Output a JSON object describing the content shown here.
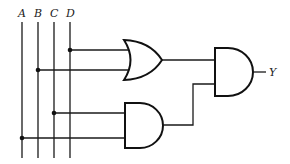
{
  "diagram": {
    "type": "logic-circuit",
    "inputs": [
      {
        "label": "A",
        "x": 22
      },
      {
        "label": "B",
        "x": 38
      },
      {
        "label": "C",
        "x": 54
      },
      {
        "label": "D",
        "x": 70
      }
    ],
    "gates": [
      {
        "id": "or1",
        "type": "OR",
        "inputs": [
          "D",
          "B"
        ]
      },
      {
        "id": "and1",
        "type": "AND",
        "inputs": [
          "C",
          "A"
        ]
      },
      {
        "id": "and2",
        "type": "AND",
        "inputs": [
          "or1",
          "and1"
        ],
        "output": "Y"
      }
    ],
    "output": {
      "label": "Y"
    },
    "colors": {
      "line": "#111111",
      "background": "#ffffff"
    }
  }
}
